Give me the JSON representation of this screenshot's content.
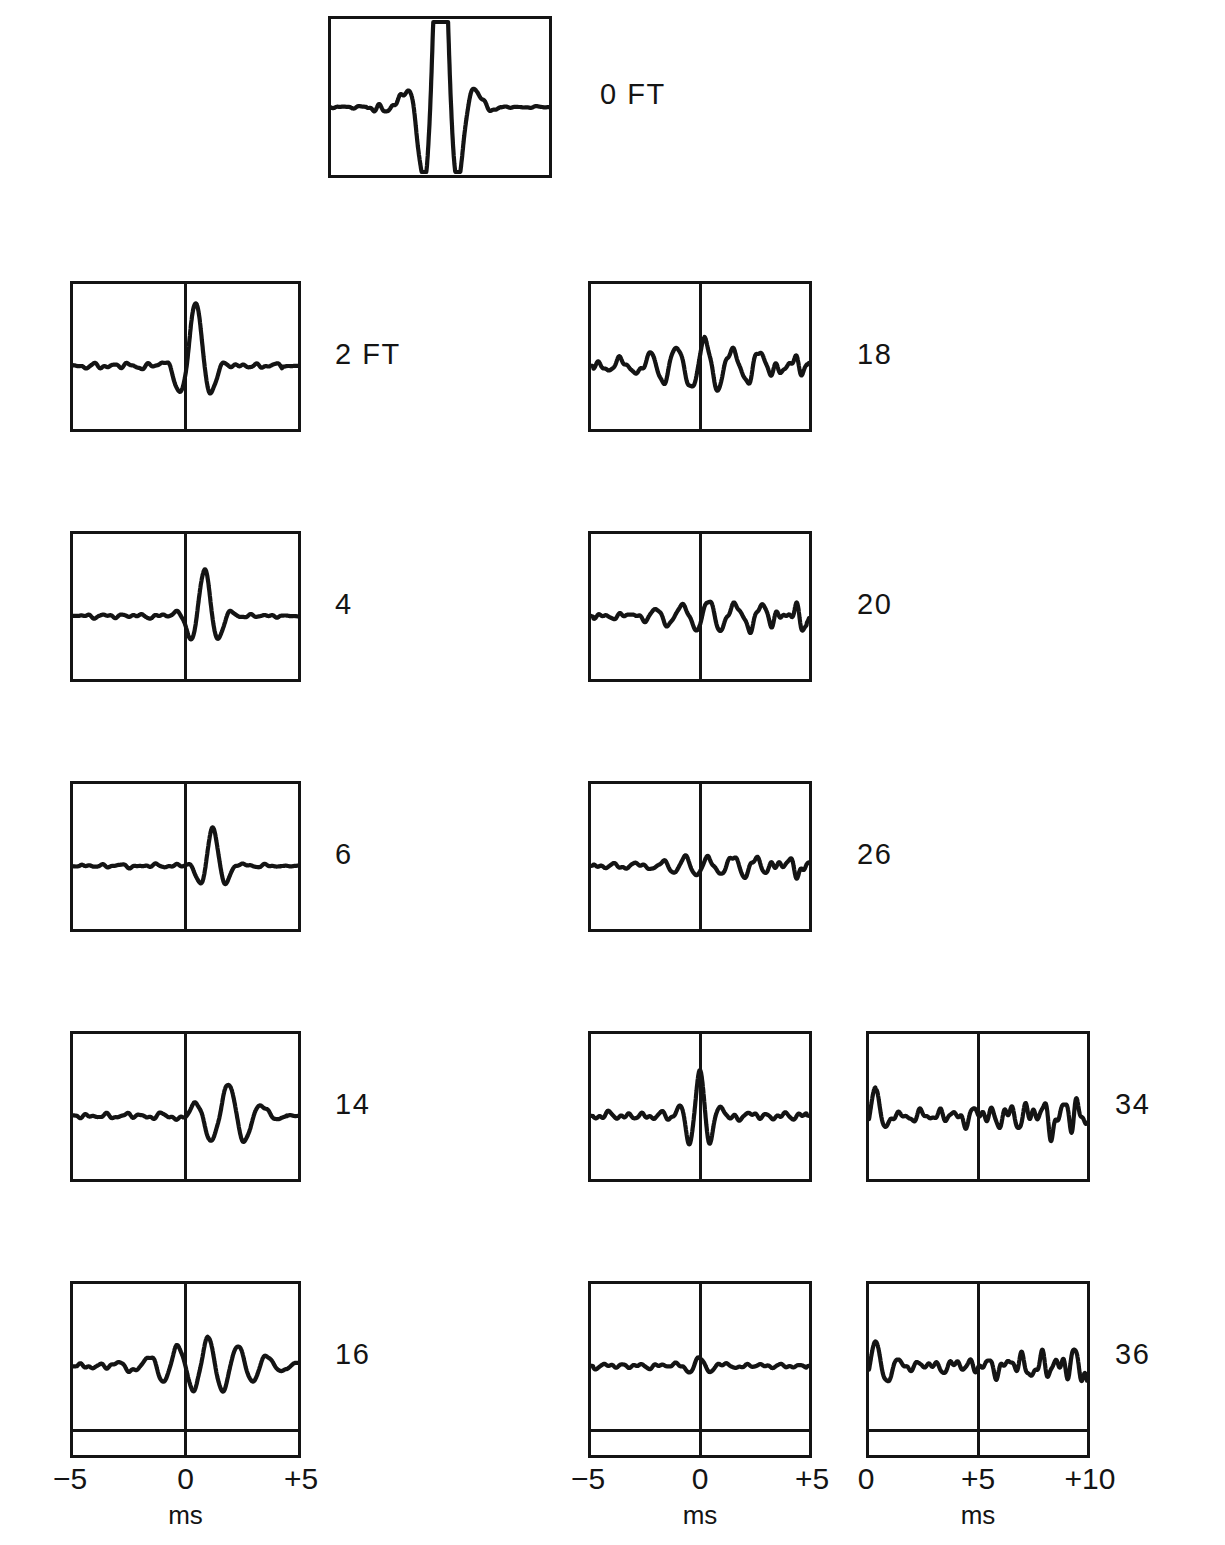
{
  "figure": {
    "background_color": "#ffffff",
    "ink_color": "#141414"
  },
  "chart_data": {
    "type": "line",
    "xlabel": "ms",
    "ylabel": "",
    "grid": false,
    "legend": "none",
    "panels": [
      {
        "id": "p0",
        "label": "0 FT",
        "distance_ft": 0,
        "column": "top",
        "row": 0,
        "has_center_line": false,
        "xlim": [
          -5,
          5
        ],
        "axis_group": "axis-left",
        "peak_amplitude_norm": 1.0,
        "notes": "Largest amplitude: very tall narrow central spike with flanking side lobes"
      },
      {
        "id": "p2",
        "label": "2 FT",
        "distance_ft": 2,
        "column": "left",
        "row": 1,
        "has_center_line": true,
        "xlim": [
          -5,
          5
        ],
        "axis_group": "axis-left",
        "peak_amplitude_norm": 0.55,
        "notes": "Sharp wavelet starting right at 0 ms"
      },
      {
        "id": "p4",
        "label": "4",
        "distance_ft": 4,
        "column": "left",
        "row": 2,
        "has_center_line": true,
        "xlim": [
          -5,
          5
        ],
        "axis_group": "axis-left",
        "peak_amplitude_norm": 0.45,
        "notes": "Wavelet just after 0 ms"
      },
      {
        "id": "p6",
        "label": "6",
        "distance_ft": 6,
        "column": "left",
        "row": 3,
        "has_center_line": true,
        "xlim": [
          -5,
          5
        ],
        "axis_group": "axis-left",
        "peak_amplitude_norm": 0.36,
        "notes": "Wavelet delayed further past 0 ms"
      },
      {
        "id": "p14",
        "label": "14",
        "distance_ft": 14,
        "column": "left",
        "row": 4,
        "has_center_line": true,
        "xlim": [
          -5,
          5
        ],
        "axis_group": "axis-left",
        "peak_amplitude_norm": 0.3,
        "notes": "Dispersed multi-cycle wave train after 0 ms"
      },
      {
        "id": "p16",
        "label": "16",
        "distance_ft": 16,
        "column": "left",
        "row": 5,
        "has_center_line": true,
        "xlim": [
          -5,
          5
        ],
        "axis_group": "axis-left",
        "peak_amplitude_norm": 0.28,
        "notes": "Extended oscillatory train centred near 0 ms"
      },
      {
        "id": "p18",
        "label": "18",
        "distance_ft": 18,
        "column": "middle",
        "row": 1,
        "has_center_line": true,
        "xlim": [
          -5,
          5
        ],
        "axis_group": "axis-middle",
        "peak_amplitude_norm": 0.26,
        "notes": "Low amplitude ringing across the whole record"
      },
      {
        "id": "p20",
        "label": "20",
        "distance_ft": 20,
        "column": "middle",
        "row": 2,
        "has_center_line": true,
        "xlim": [
          -5,
          5
        ],
        "axis_group": "axis-middle",
        "peak_amplitude_norm": 0.22,
        "notes": "Weak coda growing toward +5 ms"
      },
      {
        "id": "p26",
        "label": "26",
        "distance_ft": 26,
        "column": "middle",
        "row": 3,
        "has_center_line": true,
        "xlim": [
          -5,
          5
        ],
        "axis_group": "axis-middle",
        "peak_amplitude_norm": 0.18,
        "notes": "Very low amplitude high frequency ripple"
      },
      {
        "id": "pMid4",
        "label": "",
        "distance_ft": null,
        "column": "middle",
        "row": 4,
        "has_center_line": true,
        "xlim": [
          -5,
          5
        ],
        "axis_group": "axis-middle",
        "peak_amplitude_norm": 0.34,
        "notes": "Unlabelled panel: compact wave packet right at 0 ms"
      },
      {
        "id": "pMid5",
        "label": "",
        "distance_ft": null,
        "column": "middle",
        "row": 5,
        "has_center_line": true,
        "xlim": [
          -5,
          5
        ],
        "axis_group": "axis-middle",
        "peak_amplitude_norm": 0.14,
        "notes": "Unlabelled panel: nearly flat low amplitude trace"
      },
      {
        "id": "p34",
        "label": "34",
        "distance_ft": 34,
        "column": "right",
        "row": 4,
        "has_center_line": true,
        "xlim": [
          0,
          10
        ],
        "axis_group": "axis-right",
        "peak_amplitude_norm": 0.3,
        "notes": "Long ringing train, amplitude increasing after +5 ms"
      },
      {
        "id": "p36",
        "label": "36",
        "distance_ft": 36,
        "column": "right",
        "row": 5,
        "has_center_line": true,
        "xlim": [
          0,
          10
        ],
        "axis_group": "axis-right",
        "peak_amplitude_norm": 0.26,
        "notes": "Emergent arrival at start, later oscillation burst"
      }
    ],
    "axes": [
      {
        "id": "axis-left",
        "ticks": [
          "−5",
          "0",
          "+5"
        ],
        "unit": "ms",
        "xlim": [
          -5,
          5
        ]
      },
      {
        "id": "axis-middle",
        "ticks": [
          "−5",
          "0",
          "+5"
        ],
        "unit": "ms",
        "xlim": [
          -5,
          5
        ]
      },
      {
        "id": "axis-right",
        "ticks": [
          "0",
          "+5",
          "+10"
        ],
        "unit": "ms",
        "xlim": [
          0,
          10
        ]
      }
    ]
  }
}
